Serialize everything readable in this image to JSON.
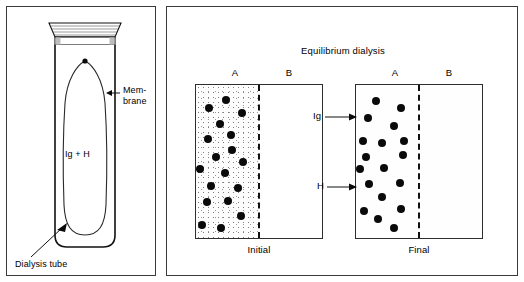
{
  "figure": {
    "left_panel": {
      "name": "dialysis-tube-diagram",
      "labels": {
        "membrane": "Mem-\nbrane",
        "contents": "Ig + H",
        "dialysis_tube": "Dialysis tube"
      }
    },
    "right_panel": {
      "title": "Equilibrium dialysis",
      "compartment_labels": {
        "left": "A",
        "right": "B"
      },
      "pointer_labels": {
        "immunoglobulin": "Ig",
        "hapten": "H"
      },
      "experiments": [
        {
          "caption": "Initial"
        },
        {
          "caption": "Final"
        }
      ]
    }
  },
  "chart_data": {
    "type": "diagram",
    "title": "Equilibrium dialysis",
    "legend": [
      {
        "symbol": "black-dot",
        "label": "Ig",
        "meaning": "immunoglobulin, cannot cross membrane"
      },
      {
        "symbol": "stipple",
        "label": "H",
        "meaning": "hapten, small molecule, crosses membrane"
      }
    ],
    "panels": [
      {
        "caption": "Initial",
        "compartments": [
          {
            "name": "A",
            "stipple": "dense",
            "dot_count": 17
          },
          {
            "name": "B",
            "stipple": "none",
            "dot_count": 0
          }
        ],
        "membrane": "dashed-vertical",
        "dots": [
          {
            "x": 30,
            "y": 15
          },
          {
            "x": 13,
            "y": 23
          },
          {
            "x": 46,
            "y": 28
          },
          {
            "x": 24,
            "y": 39
          },
          {
            "x": 12,
            "y": 54
          },
          {
            "x": 35,
            "y": 50
          },
          {
            "x": 36,
            "y": 65
          },
          {
            "x": 20,
            "y": 72
          },
          {
            "x": 47,
            "y": 77
          },
          {
            "x": 4,
            "y": 84
          },
          {
            "x": 29,
            "y": 88
          },
          {
            "x": 15,
            "y": 101
          },
          {
            "x": 42,
            "y": 103
          },
          {
            "x": 11,
            "y": 117
          },
          {
            "x": 32,
            "y": 116
          },
          {
            "x": 45,
            "y": 131
          },
          {
            "x": 6,
            "y": 140
          },
          {
            "x": 25,
            "y": 143
          }
        ]
      },
      {
        "caption": "Final",
        "compartments": [
          {
            "name": "A",
            "stipple": "light",
            "dot_count": 17
          },
          {
            "name": "B",
            "stipple": "light",
            "dot_count": 0
          }
        ],
        "membrane": "dashed-vertical",
        "dots": [
          {
            "x": 20,
            "y": 16
          },
          {
            "x": 45,
            "y": 23
          },
          {
            "x": 12,
            "y": 33
          },
          {
            "x": 38,
            "y": 41
          },
          {
            "x": 7,
            "y": 56
          },
          {
            "x": 26,
            "y": 58
          },
          {
            "x": 48,
            "y": 56
          },
          {
            "x": 10,
            "y": 72
          },
          {
            "x": 47,
            "y": 70
          },
          {
            "x": 4,
            "y": 84
          },
          {
            "x": 28,
            "y": 83
          },
          {
            "x": 13,
            "y": 99
          },
          {
            "x": 44,
            "y": 98
          },
          {
            "x": 26,
            "y": 112
          },
          {
            "x": 8,
            "y": 126
          },
          {
            "x": 45,
            "y": 124
          },
          {
            "x": 22,
            "y": 134
          },
          {
            "x": 38,
            "y": 143
          }
        ]
      }
    ]
  }
}
